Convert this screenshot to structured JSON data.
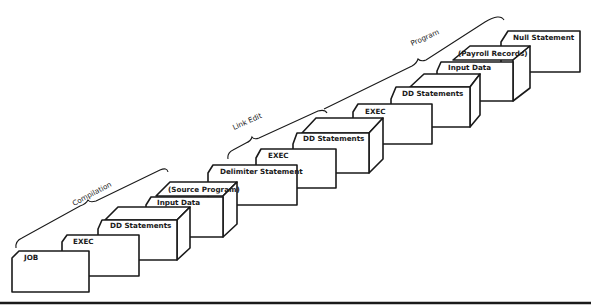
{
  "diagram": {
    "type": "job-stream-card-deck",
    "phases": [
      {
        "label": "Compilation"
      },
      {
        "label": "Link Edit"
      },
      {
        "label": "Program"
      }
    ],
    "cards": [
      {
        "label": "JOB",
        "kind": "card"
      },
      {
        "label": "EXEC",
        "kind": "card"
      },
      {
        "label": "DD Statements",
        "kind": "deck"
      },
      {
        "label": "Input Data",
        "kind": "card"
      },
      {
        "label": "(Source Program)",
        "kind": "deck"
      },
      {
        "label": "Delimiter Statement",
        "kind": "card"
      },
      {
        "label": "EXEC",
        "kind": "card"
      },
      {
        "label": "DD Statements",
        "kind": "deck"
      },
      {
        "label": "EXEC",
        "kind": "card"
      },
      {
        "label": "DD Statements",
        "kind": "deck"
      },
      {
        "label": "Input Data",
        "kind": "card"
      },
      {
        "label": "(Payroll Records)",
        "kind": "deck"
      },
      {
        "label": "Null Statement",
        "kind": "card"
      }
    ]
  }
}
